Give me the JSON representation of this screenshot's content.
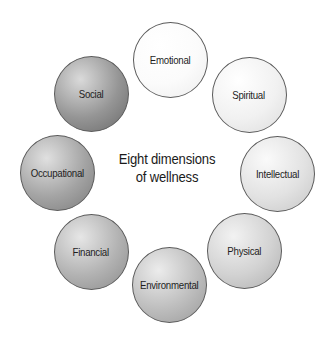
{
  "title": {
    "line1": "Eight dimensions",
    "line2": "of wellness"
  },
  "dimensions": [
    {
      "label": "Emotional",
      "cx": 170,
      "cy": 60,
      "light": "#ffffff",
      "mid": "#fbfbfb",
      "dark": "#ececec"
    },
    {
      "label": "Spiritual",
      "cx": 249,
      "cy": 95,
      "light": "#ffffff",
      "mid": "#f1f1f1",
      "dark": "#dcdcdc"
    },
    {
      "label": "Intellectual",
      "cx": 277,
      "cy": 174,
      "light": "#fafafa",
      "mid": "#e2e2e2",
      "dark": "#c6c6c6"
    },
    {
      "label": "Physical",
      "cx": 244,
      "cy": 251,
      "light": "#f2f2f2",
      "mid": "#d2d2d2",
      "dark": "#b0b0b0"
    },
    {
      "label": "Environmental",
      "cx": 169,
      "cy": 285,
      "light": "#ececec",
      "mid": "#bebebe",
      "dark": "#9a9a9a"
    },
    {
      "label": "Financial",
      "cx": 91,
      "cy": 252,
      "light": "#e6e6e6",
      "mid": "#b2b2b2",
      "dark": "#8c8c8c"
    },
    {
      "label": "Occupational",
      "cx": 57,
      "cy": 173,
      "light": "#e0e0e0",
      "mid": "#a4a4a4",
      "dark": "#7c7c7c"
    },
    {
      "label": "Social",
      "cx": 91,
      "cy": 94,
      "light": "#dadada",
      "mid": "#959595",
      "dark": "#6a6a6a"
    }
  ]
}
